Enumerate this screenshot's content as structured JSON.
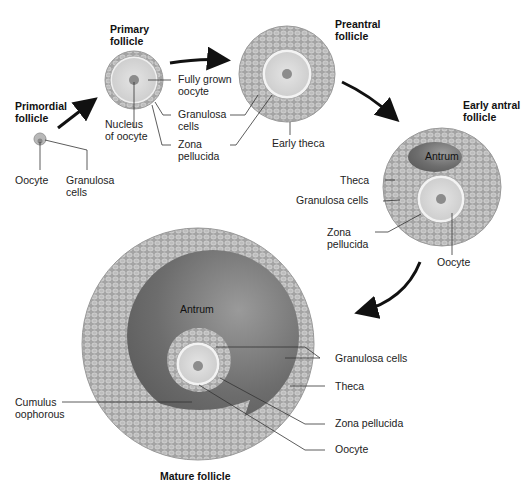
{
  "diagram": {
    "stages": [
      {
        "id": "primordial",
        "title": "Primordial\nfollicle",
        "labels": [
          "Oocyte",
          "Granulosa\ncells"
        ]
      },
      {
        "id": "primary",
        "title": "Primary\nfollicle",
        "labels": [
          "Fully grown\noocyte",
          "Granulosa\ncells",
          "Zona\npellucida",
          "Nucleus\nof oocyte"
        ]
      },
      {
        "id": "preantral",
        "title": "Preantral\nfollicle",
        "labels": [
          "Early theca"
        ]
      },
      {
        "id": "early_antral",
        "title": "Early antral\nfollicle",
        "labels": [
          "Antrum",
          "Theca",
          "Granulosa cells",
          "Zona\npellucida",
          "Oocyte"
        ]
      },
      {
        "id": "mature",
        "title": "Mature follicle",
        "labels": [
          "Antrum",
          "Granulosa cells",
          "Theca",
          "Zona pellucida",
          "Oocyte",
          "Cumulus\noophorous"
        ]
      }
    ],
    "colors": {
      "cells": "#a9a9a9",
      "cell_outline": "#d4d4d4",
      "oocyte": "#dcdcdc",
      "nucleus": "#8c8c8c",
      "antrum": "#6e6e6e",
      "arrow": "#111111"
    }
  }
}
